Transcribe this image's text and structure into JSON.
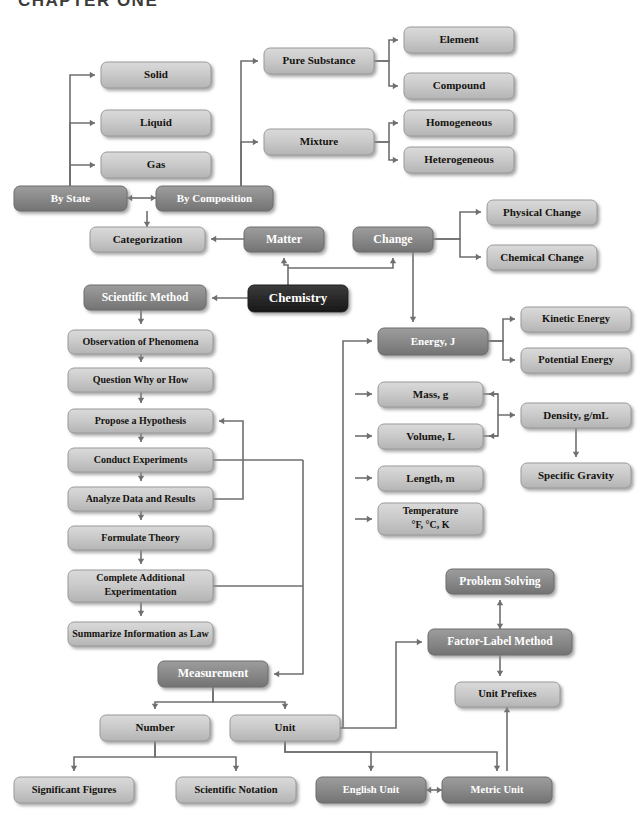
{
  "page": {
    "header": "CHAPTER ONE",
    "width": 644,
    "height": 825
  },
  "styles": {
    "light_fill": "#c9c9c9",
    "mid_fill": "#8a8a8a",
    "dark_fill": "#2a2a2a",
    "edge_color": "#6f6f6f",
    "light_text": "#15130f",
    "mid_text": "#ffffff",
    "dark_text": "#ffffff"
  },
  "nodes": [
    {
      "id": "solid",
      "label": "Solid",
      "x": 101,
      "y": 62,
      "w": 110,
      "h": 26,
      "tone": "light",
      "fs": 11
    },
    {
      "id": "liquid",
      "label": "Liquid",
      "x": 101,
      "y": 110,
      "w": 110,
      "h": 26,
      "tone": "light",
      "fs": 11
    },
    {
      "id": "gas",
      "label": "Gas",
      "x": 101,
      "y": 152,
      "w": 110,
      "h": 26,
      "tone": "light",
      "fs": 11
    },
    {
      "id": "by-state",
      "label": "By State",
      "x": 14,
      "y": 186,
      "w": 113,
      "h": 25,
      "tone": "mid",
      "fs": 11
    },
    {
      "id": "by-composition",
      "label": "By Composition",
      "x": 156,
      "y": 186,
      "w": 117,
      "h": 25,
      "tone": "mid",
      "fs": 11
    },
    {
      "id": "pure-substance",
      "label": "Pure Substance",
      "x": 264,
      "y": 48,
      "w": 110,
      "h": 26,
      "tone": "light",
      "fs": 11
    },
    {
      "id": "mixture",
      "label": "Mixture",
      "x": 264,
      "y": 129,
      "w": 110,
      "h": 26,
      "tone": "light",
      "fs": 11
    },
    {
      "id": "element",
      "label": "Element",
      "x": 404,
      "y": 27,
      "w": 110,
      "h": 26,
      "tone": "light",
      "fs": 11
    },
    {
      "id": "compound",
      "label": "Compound",
      "x": 404,
      "y": 73,
      "w": 110,
      "h": 26,
      "tone": "light",
      "fs": 11
    },
    {
      "id": "homogeneous",
      "label": "Homogeneous",
      "x": 404,
      "y": 110,
      "w": 110,
      "h": 26,
      "tone": "light",
      "fs": 11
    },
    {
      "id": "heterogeneous",
      "label": "Heterogeneous",
      "x": 404,
      "y": 147,
      "w": 110,
      "h": 26,
      "tone": "light",
      "fs": 11
    },
    {
      "id": "categorization",
      "label": "Categorization",
      "x": 90,
      "y": 227,
      "w": 115,
      "h": 25,
      "tone": "light",
      "fs": 11
    },
    {
      "id": "matter",
      "label": "Matter",
      "x": 244,
      "y": 227,
      "w": 80,
      "h": 25,
      "tone": "mid",
      "fs": 12
    },
    {
      "id": "change",
      "label": "Change",
      "x": 353,
      "y": 227,
      "w": 80,
      "h": 25,
      "tone": "mid",
      "fs": 12
    },
    {
      "id": "physical-change",
      "label": "Physical Change",
      "x": 487,
      "y": 200,
      "w": 110,
      "h": 25,
      "tone": "light",
      "fs": 11
    },
    {
      "id": "chemical-change",
      "label": "Chemical Change",
      "x": 487,
      "y": 245,
      "w": 110,
      "h": 25,
      "tone": "light",
      "fs": 11
    },
    {
      "id": "chemistry",
      "label": "Chemistry",
      "x": 248,
      "y": 285,
      "w": 100,
      "h": 27,
      "tone": "dark",
      "fs": 13
    },
    {
      "id": "scientific-method",
      "label": "Scientific Method",
      "x": 84,
      "y": 285,
      "w": 122,
      "h": 25,
      "tone": "mid",
      "fs": 11.5
    },
    {
      "id": "observation",
      "label": "Observation of Phenomena",
      "x": 68,
      "y": 330,
      "w": 145,
      "h": 24,
      "tone": "light",
      "fs": 10
    },
    {
      "id": "question",
      "label": "Question Why or How",
      "x": 68,
      "y": 368,
      "w": 145,
      "h": 24,
      "tone": "light",
      "fs": 10
    },
    {
      "id": "hypothesis",
      "label": "Propose a Hypothesis",
      "x": 68,
      "y": 409,
      "w": 145,
      "h": 24,
      "tone": "light",
      "fs": 10
    },
    {
      "id": "conduct",
      "label": "Conduct Experiments",
      "x": 68,
      "y": 448,
      "w": 145,
      "h": 24,
      "tone": "light",
      "fs": 10
    },
    {
      "id": "analyze",
      "label": "Analyze Data and Results",
      "x": 68,
      "y": 487,
      "w": 145,
      "h": 24,
      "tone": "light",
      "fs": 10
    },
    {
      "id": "theory",
      "label": "Formulate Theory",
      "x": 68,
      "y": 526,
      "w": 145,
      "h": 24,
      "tone": "light",
      "fs": 10
    },
    {
      "id": "complete-add",
      "label": "Complete Additional",
      "label2": "Experimentation",
      "x": 68,
      "y": 570,
      "w": 145,
      "h": 32,
      "tone": "light",
      "fs": 10
    },
    {
      "id": "summarize",
      "label": "Summarize Information as Law",
      "x": 68,
      "y": 622,
      "w": 145,
      "h": 24,
      "tone": "light",
      "fs": 10
    },
    {
      "id": "energy",
      "label": "Energy, J",
      "x": 378,
      "y": 328,
      "w": 110,
      "h": 27,
      "tone": "mid",
      "fs": 11
    },
    {
      "id": "kinetic",
      "label": "Kinetic Energy",
      "x": 521,
      "y": 307,
      "w": 110,
      "h": 25,
      "tone": "light",
      "fs": 10.5
    },
    {
      "id": "potential",
      "label": "Potential Energy",
      "x": 521,
      "y": 348,
      "w": 110,
      "h": 25,
      "tone": "light",
      "fs": 10.5
    },
    {
      "id": "mass",
      "label": "Mass, g",
      "x": 378,
      "y": 382,
      "w": 105,
      "h": 25,
      "tone": "light",
      "fs": 11
    },
    {
      "id": "volume",
      "label": "Volume, L",
      "x": 378,
      "y": 424,
      "w": 105,
      "h": 25,
      "tone": "light",
      "fs": 11
    },
    {
      "id": "density",
      "label": "Density, g/mL",
      "x": 521,
      "y": 403,
      "w": 110,
      "h": 25,
      "tone": "light",
      "fs": 11
    },
    {
      "id": "specific-gravity",
      "label": "Specific Gravity",
      "x": 521,
      "y": 463,
      "w": 110,
      "h": 25,
      "tone": "light",
      "fs": 11
    },
    {
      "id": "length",
      "label": "Length, m",
      "x": 378,
      "y": 466,
      "w": 105,
      "h": 25,
      "tone": "light",
      "fs": 11
    },
    {
      "id": "temperature",
      "label": "Temperature",
      "label2": "°F, °C, K",
      "x": 378,
      "y": 503,
      "w": 105,
      "h": 32,
      "tone": "light",
      "fs": 10
    },
    {
      "id": "problem-solving",
      "label": "Problem Solving",
      "x": 446,
      "y": 569,
      "w": 108,
      "h": 25,
      "tone": "mid",
      "fs": 11.5
    },
    {
      "id": "factor-label",
      "label": "Factor-Label Method",
      "x": 428,
      "y": 629,
      "w": 144,
      "h": 26,
      "tone": "mid",
      "fs": 11.5
    },
    {
      "id": "unit-prefixes",
      "label": "Unit Prefixes",
      "x": 455,
      "y": 682,
      "w": 105,
      "h": 25,
      "tone": "light",
      "fs": 10.5
    },
    {
      "id": "measurement",
      "label": "Measurement",
      "x": 158,
      "y": 661,
      "w": 110,
      "h": 26,
      "tone": "mid",
      "fs": 12
    },
    {
      "id": "number",
      "label": "Number",
      "x": 100,
      "y": 715,
      "w": 110,
      "h": 26,
      "tone": "light",
      "fs": 11
    },
    {
      "id": "unit",
      "label": "Unit",
      "x": 230,
      "y": 715,
      "w": 110,
      "h": 26,
      "tone": "light",
      "fs": 11
    },
    {
      "id": "significant-figures",
      "label": "Significant Figures",
      "x": 14,
      "y": 777,
      "w": 120,
      "h": 26,
      "tone": "light",
      "fs": 10.5
    },
    {
      "id": "scientific-notation",
      "label": "Scientific Notation",
      "x": 176,
      "y": 777,
      "w": 120,
      "h": 26,
      "tone": "light",
      "fs": 10.5
    },
    {
      "id": "english-unit",
      "label": "English Unit",
      "x": 316,
      "y": 777,
      "w": 110,
      "h": 26,
      "tone": "mid",
      "fs": 10.5
    },
    {
      "id": "metric-unit",
      "label": "Metric Unit",
      "x": 442,
      "y": 777,
      "w": 110,
      "h": 26,
      "tone": "mid",
      "fs": 10.5
    }
  ],
  "edges": [
    {
      "from": "by-state",
      "to": "solid",
      "path": "M 70 186 L 70 75 L 95 75",
      "arrow": "right"
    },
    {
      "from": "by-state",
      "to": "liquid",
      "path": "M 70 186 L 70 123 L 95 123",
      "arrow": "right"
    },
    {
      "from": "by-state",
      "to": "gas",
      "path": "M 70 186 L 70 165 L 95 165",
      "arrow": "right"
    },
    {
      "from": "by-state",
      "to": "by-composition",
      "path": "M 127 198 L 156 198",
      "arrow": "both"
    },
    {
      "from": "by-composition",
      "to": "pure-substance",
      "path": "M 241 186 L 241 61 L 258 61",
      "arrow": "right"
    },
    {
      "from": "by-composition",
      "to": "mixture",
      "path": "M 241 186 L 241 142 L 258 142",
      "arrow": "right"
    },
    {
      "from": "pure-substance",
      "to": "element",
      "path": "M 374 61 L 389 61 L 389 40 L 398 40",
      "arrow": "right"
    },
    {
      "from": "pure-substance",
      "to": "compound",
      "path": "M 374 61 L 389 61 L 389 86 L 398 86",
      "arrow": "right"
    },
    {
      "from": "mixture",
      "to": "homogeneous",
      "path": "M 374 142 L 389 142 L 389 123 L 398 123",
      "arrow": "right"
    },
    {
      "from": "mixture",
      "to": "heterogeneous",
      "path": "M 374 142 L 389 142 L 389 160 L 398 160",
      "arrow": "right"
    },
    {
      "from": "composition-junction",
      "to": "categorization",
      "path": "M 147 211 L 147 227",
      "arrow": "down"
    },
    {
      "from": "matter",
      "to": "categorization",
      "path": "M 244 239 L 211 239",
      "arrow": "left"
    },
    {
      "from": "chemistry",
      "to": "matter",
      "path": "M 288 285 L 288 265 L 284 265 L 284 258",
      "arrow": "up"
    },
    {
      "from": "chemistry",
      "to": "change",
      "path": "M 288 268 L 393 268 L 393 258",
      "arrow": "up"
    },
    {
      "from": "chemistry",
      "to": "scientific-method",
      "path": "M 248 298 L 212 298",
      "arrow": "left"
    },
    {
      "from": "change",
      "to": "physical-change",
      "path": "M 433 239 L 460 239 L 460 212 L 481 212",
      "arrow": "right"
    },
    {
      "from": "change",
      "to": "chemical-change",
      "path": "M 433 239 L 460 239 L 460 257 L 481 257",
      "arrow": "right"
    },
    {
      "from": "change",
      "to": "energy",
      "path": "M 413 252 L 413 322",
      "arrow": "down"
    },
    {
      "from": "scientific-method",
      "to": "observation",
      "path": "M 141 310 L 141 324",
      "arrow": "down"
    },
    {
      "from": "observation",
      "to": "question",
      "path": "M 141 354 L 141 362",
      "arrow": "down"
    },
    {
      "from": "question",
      "to": "hypothesis",
      "path": "M 141 392 L 141 403",
      "arrow": "down"
    },
    {
      "from": "hypothesis",
      "to": "conduct",
      "path": "M 141 433 L 141 442",
      "arrow": "down"
    },
    {
      "from": "conduct",
      "to": "analyze",
      "path": "M 141 472 L 141 481",
      "arrow": "down"
    },
    {
      "from": "analyze",
      "to": "theory",
      "path": "M 141 511 L 141 520",
      "arrow": "down"
    },
    {
      "from": "theory",
      "to": "complete-add",
      "path": "M 141 550 L 141 564",
      "arrow": "down"
    },
    {
      "from": "complete-add",
      "to": "summarize",
      "path": "M 141 602 L 141 616",
      "arrow": "down"
    },
    {
      "from": "analyze",
      "to": "hypothesis",
      "path": "M 213 499 L 243 499 L 243 421 L 219 421",
      "arrow": "left"
    },
    {
      "from": "conduct",
      "to": "rail",
      "path": "M 213 460 L 303 460",
      "arrow": "none"
    },
    {
      "from": "complete-add",
      "to": "rail",
      "path": "M 213 586 L 303 586",
      "arrow": "none"
    },
    {
      "from": "rail",
      "to": "measurement",
      "path": "M 303 460 L 303 674 L 274 674",
      "arrow": "left"
    },
    {
      "from": "measurement",
      "to": "number",
      "path": "M 213 687 L 213 702 L 155 702 L 155 709",
      "arrow": "down"
    },
    {
      "from": "measurement",
      "to": "unit",
      "path": "M 213 687 L 213 702 L 285 702 L 285 709",
      "arrow": "down"
    },
    {
      "from": "number",
      "to": "significant-figures",
      "path": "M 155 741 L 155 757 L 74 757 L 74 771",
      "arrow": "down"
    },
    {
      "from": "number",
      "to": "scientific-notation",
      "path": "M 155 741 L 155 757 L 236 757 L 236 771",
      "arrow": "down"
    },
    {
      "from": "unit",
      "to": "english-unit",
      "path": "M 285 741 L 285 752 L 371 752 L 371 771",
      "arrow": "down"
    },
    {
      "from": "unit",
      "to": "metric-unit",
      "path": "M 285 741 L 285 752 L 497 752 L 497 771",
      "arrow": "down"
    },
    {
      "from": "english-unit",
      "to": "metric-unit",
      "path": "M 426 790 L 442 790",
      "arrow": "both"
    },
    {
      "from": "metric-unit",
      "to": "unit-prefixes",
      "path": "M 507 771 L 507 707",
      "arrow": "up"
    },
    {
      "from": "unit",
      "to": "quantity-rail",
      "path": "M 340 728 L 343 728",
      "arrow": "none"
    },
    {
      "from": "quantity-rail",
      "to": "energy",
      "path": "M 343 728 L 343 341 L 372 341",
      "arrow": "right"
    },
    {
      "from": "quantity-rail",
      "to": "mass",
      "path": "M 355 394 L 372 394",
      "arrow": "right"
    },
    {
      "from": "quantity-rail",
      "to": "volume",
      "path": "M 355 436 L 372 436",
      "arrow": "right"
    },
    {
      "from": "quantity-rail",
      "to": "length",
      "path": "M 355 478 L 372 478",
      "arrow": "right"
    },
    {
      "from": "quantity-rail",
      "to": "temperature",
      "path": "M 355 519 L 372 519",
      "arrow": "right"
    },
    {
      "from": "energy",
      "to": "kinetic",
      "path": "M 488 341 L 503 341 L 503 319 L 515 319",
      "arrow": "right"
    },
    {
      "from": "energy",
      "to": "potential",
      "path": "M 488 341 L 503 341 L 503 360 L 515 360",
      "arrow": "right"
    },
    {
      "from": "mass",
      "to": "density",
      "path": "M 483 394 L 498 394 L 498 415 L 515 415",
      "arrow": "right"
    },
    {
      "from": "density-junction",
      "to": "mass",
      "path": "M 498 394 L 489 394",
      "arrow": "left"
    },
    {
      "from": "density-junction",
      "to": "volume",
      "path": "M 498 436 L 489 436",
      "arrow": "left"
    },
    {
      "from": "volume",
      "to": "density",
      "path": "M 483 436 L 498 436 L 498 415",
      "arrow": "none"
    },
    {
      "from": "density",
      "to": "specific-gravity",
      "path": "M 576 428 L 576 457",
      "arrow": "down"
    },
    {
      "from": "unit",
      "to": "factor-label",
      "path": "M 340 728 L 396 728 L 396 642 L 422 642",
      "arrow": "right"
    },
    {
      "from": "factor-label",
      "to": "problem-solving",
      "path": "M 500 629 L 500 600",
      "arrow": "both"
    },
    {
      "from": "factor-label",
      "to": "unit-prefixes",
      "path": "M 500 655 L 500 676",
      "arrow": "down"
    }
  ]
}
